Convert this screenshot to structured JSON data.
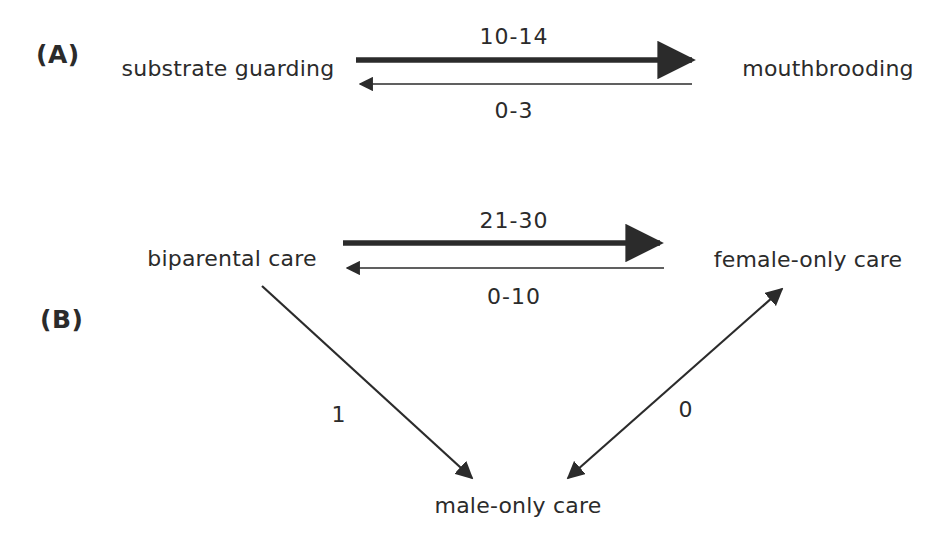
{
  "figure": {
    "background_color": "#ffffff",
    "ink_color": "#2b2b2b",
    "panels": [
      {
        "id": "A",
        "label": "(A)",
        "nodes": [
          {
            "id": "substrate-guarding",
            "label": "substrate guarding"
          },
          {
            "id": "mouthbrooding",
            "label": "mouthbrooding"
          }
        ],
        "edges": [
          {
            "id": "sg-to-mb",
            "label": "10-14",
            "from": "substrate guarding",
            "to": "mouthbrooding",
            "direction": "right",
            "weight": "thick"
          },
          {
            "id": "mb-to-sg",
            "label": "0-3",
            "from": "mouthbrooding",
            "to": "substrate guarding",
            "direction": "left",
            "weight": "thin"
          }
        ]
      },
      {
        "id": "B",
        "label": "(B)",
        "nodes": [
          {
            "id": "biparental-care",
            "label": "biparental care"
          },
          {
            "id": "female-only-care",
            "label": "female-only care"
          },
          {
            "id": "male-only-care",
            "label": "male-only care"
          }
        ],
        "edges": [
          {
            "id": "bp-to-fo",
            "label": "21-30",
            "from": "biparental care",
            "to": "female-only care",
            "direction": "right",
            "weight": "thick"
          },
          {
            "id": "fo-to-bp",
            "label": "0-10",
            "from": "female-only care",
            "to": "biparental care",
            "direction": "left",
            "weight": "thin"
          },
          {
            "id": "bp-to-mo",
            "label": "1",
            "from": "biparental care",
            "to": "male-only care",
            "direction": "down-right",
            "weight": "thin"
          },
          {
            "id": "mo-fo",
            "label": "0",
            "from": "male-only care",
            "to": "female-only care",
            "direction": "bidirectional",
            "weight": "thin"
          }
        ]
      }
    ]
  }
}
